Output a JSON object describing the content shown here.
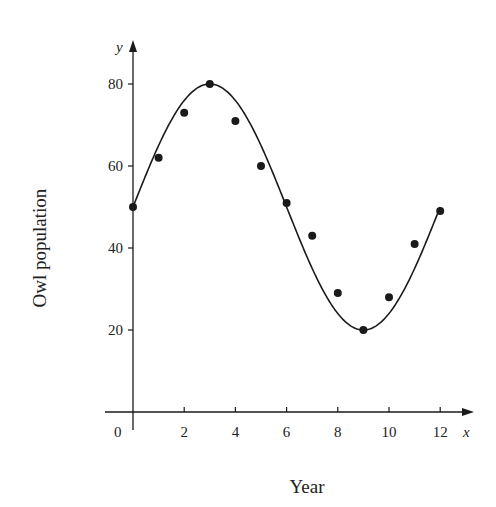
{
  "chart_data": {
    "type": "scatter",
    "title": "",
    "xlabel": "Year",
    "ylabel": "Owl population",
    "x_var": "x",
    "y_var": "y",
    "xlim": [
      0,
      12.8
    ],
    "ylim": [
      0,
      88
    ],
    "x_ticks": [
      2,
      4,
      6,
      8,
      10,
      12
    ],
    "y_ticks": [
      20,
      40,
      60,
      80
    ],
    "origin_label": "0",
    "grid": false,
    "legend": null,
    "series": [
      {
        "name": "Observed population",
        "type": "scatter",
        "x": [
          0,
          1,
          2,
          3,
          4,
          5,
          6,
          7,
          8,
          9,
          10,
          11,
          12
        ],
        "y": [
          50,
          62,
          73,
          80,
          71,
          60,
          51,
          43,
          29,
          20,
          28,
          41,
          49
        ]
      },
      {
        "name": "Sinusoidal model",
        "type": "line",
        "formula": "y = 50 + 30 sin(pi x / 6)",
        "x_range": [
          0,
          12
        ],
        "amplitude": 30,
        "midline": 50,
        "period": 12
      }
    ]
  },
  "colors": {
    "ink": "#1a1a1a",
    "background": "#ffffff"
  }
}
